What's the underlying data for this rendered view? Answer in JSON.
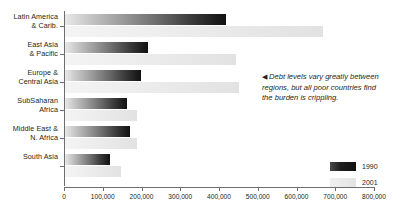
{
  "chart_data": {
    "type": "bar",
    "orientation": "horizontal",
    "title": "",
    "xlabel": "",
    "ylabel": "",
    "xlim": [
      0,
      800000
    ],
    "xticks": [
      "0",
      "100,000",
      "200,000",
      "300,000",
      "400,000",
      "500,000",
      "600,000",
      "700,000",
      "800,000"
    ],
    "xtick_values": [
      0,
      100000,
      200000,
      300000,
      400000,
      500000,
      600000,
      700000,
      800000
    ],
    "grid": false,
    "legend_position": "bottom-right",
    "categories": [
      "Latin America & Carib.",
      "East Asia & Pacific",
      "Europe & Central Asia",
      "SubSaharan Africa",
      "Middle East & N. Africa",
      "South Asia"
    ],
    "series": [
      {
        "name": "1990",
        "color": "#111111",
        "values": [
          415000,
          215000,
          195000,
          160000,
          168000,
          115000
        ]
      },
      {
        "name": "2001",
        "color": "#e4e4e4",
        "values": [
          665000,
          440000,
          450000,
          185000,
          185000,
          145000
        ]
      }
    ],
    "annotations": [
      {
        "arrow": "◀",
        "text": "Debt levels vary greatly between regions, but all poor countries find the burden is crippling."
      }
    ]
  },
  "region_labels": [
    {
      "line1": "Latin America",
      "line2": "& Carib."
    },
    {
      "line1": "East Asia",
      "line2": "& Pacific"
    },
    {
      "line1": "Europe &",
      "line2": "Central Asia"
    },
    {
      "line1": "SubSaharan",
      "line2": "Africa"
    },
    {
      "line1": "Middle East &",
      "line2": "N. Africa"
    },
    {
      "line1": "South Asia",
      "line2": ""
    }
  ],
  "legend": {
    "items": [
      {
        "label": "1990",
        "swatch": "dark-gradient-swatch"
      },
      {
        "label": "2001",
        "swatch": "light-gray-swatch"
      }
    ]
  }
}
